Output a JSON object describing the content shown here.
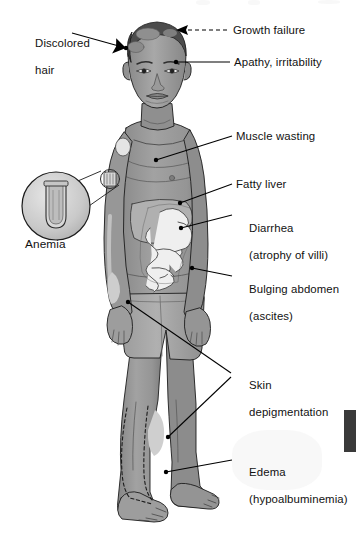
{
  "figure": {
    "type": "labeled-anatomical-illustration",
    "style": "grayscale line and tone drawing"
  },
  "labels": [
    {
      "id": "discolored-hair",
      "text": "Discolored",
      "text2": "hair",
      "leader": "solid",
      "terminator": "dot-arrow"
    },
    {
      "id": "growth-failure",
      "text": "Growth failure",
      "text2": "",
      "leader": "dashed",
      "terminator": "arrow"
    },
    {
      "id": "apathy",
      "text": "Apathy, irritability",
      "text2": "",
      "leader": "solid",
      "terminator": "dot"
    },
    {
      "id": "muscle-wasting",
      "text": "Muscle wasting",
      "text2": "",
      "leader": "solid",
      "terminator": "dot"
    },
    {
      "id": "fatty-liver",
      "text": "Fatty liver",
      "text2": "",
      "leader": "solid",
      "terminator": "dot"
    },
    {
      "id": "diarrhea",
      "text": "Diarrhea",
      "text2": "(atrophy of villi)",
      "leader": "solid",
      "terminator": "dot"
    },
    {
      "id": "bulging-abdomen",
      "text": "Bulging abdomen",
      "text2": "(ascites)",
      "leader": "solid",
      "terminator": "dot"
    },
    {
      "id": "skin-depigmentation",
      "text": "Skin",
      "text2": "depigmentation",
      "leader": "solid-forked",
      "terminator": "dot"
    },
    {
      "id": "edema",
      "text": "Edema",
      "text2": "(hypoalbuminemia)",
      "leader": "solid",
      "terminator": "dot"
    },
    {
      "id": "anemia",
      "text": "Anemia",
      "text2": "",
      "leader": "cone-callout",
      "terminator": "magnifier"
    }
  ],
  "inset": {
    "name": "anemia-blood-tube-magnifier",
    "caption": "Anemia",
    "depicts": "magnified blood collection tube showing pale, reduced red cell column"
  },
  "organs": [
    {
      "name": "liver",
      "label_ref": "fatty-liver"
    },
    {
      "name": "small-intestine",
      "label_ref": "diarrhea"
    }
  ],
  "colors": {
    "skin": "#9b9b9b",
    "skin_shadow": "#848484",
    "skin_light": "#b4b4b4",
    "hair_dark": "#4a4a4a",
    "hair_patch": "#8d8d8d",
    "shorts": "#a6a6a6",
    "liver": "#adadad",
    "intestine": "#ececec",
    "outline": "#1c1c1c",
    "leader": "#000000",
    "text": "#111111",
    "background": "#ffffff",
    "edge_tab": "#3a3a3a"
  },
  "artifacts": {
    "right_edge_tab": "dark vertical page-edge marker",
    "top_edge_cutoff": "faint clipped text remnants along top margin"
  }
}
